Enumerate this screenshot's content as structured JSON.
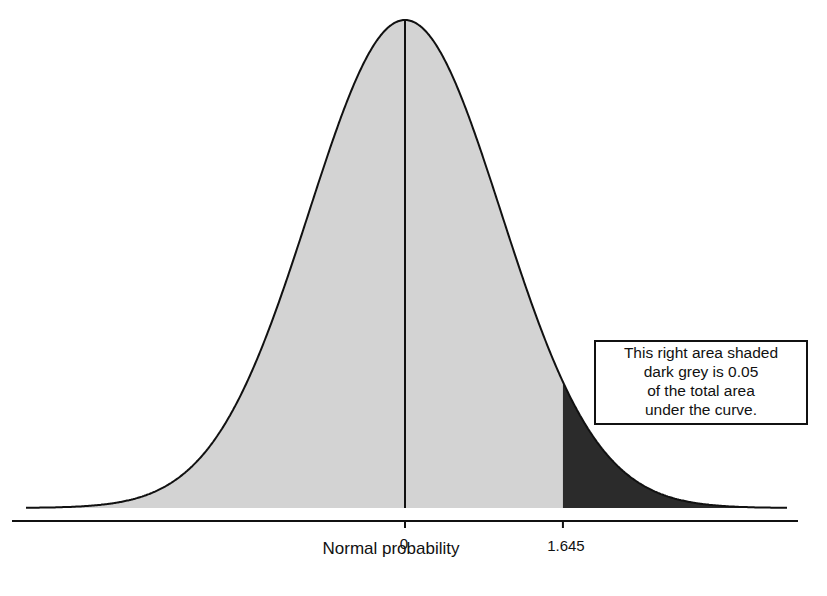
{
  "chart_data": {
    "type": "area",
    "title": "",
    "xlabel": "Normal probability",
    "ylabel": "",
    "distribution": "standard normal",
    "mean": 0,
    "sd": 1,
    "xlim": [
      -4.0,
      4.0
    ],
    "tick_labels": [
      "0",
      "1.645"
    ],
    "tick_values": [
      0,
      1.645
    ],
    "grid": false,
    "regions": [
      {
        "name": "body",
        "from": -4.0,
        "to": 1.645,
        "fill": "#d3d3d3",
        "area": 0.95
      },
      {
        "name": "right-tail",
        "from": 1.645,
        "to": 4.0,
        "fill": "#2b2b2b",
        "area": 0.05
      }
    ],
    "annotation": {
      "lines": [
        "This right area shaded",
        "dark grey is 0.05",
        "of the total area",
        "under the curve."
      ]
    }
  },
  "colors": {
    "light_fill": "#d3d3d3",
    "dark_fill": "#2b2b2b",
    "line": "#111111"
  }
}
